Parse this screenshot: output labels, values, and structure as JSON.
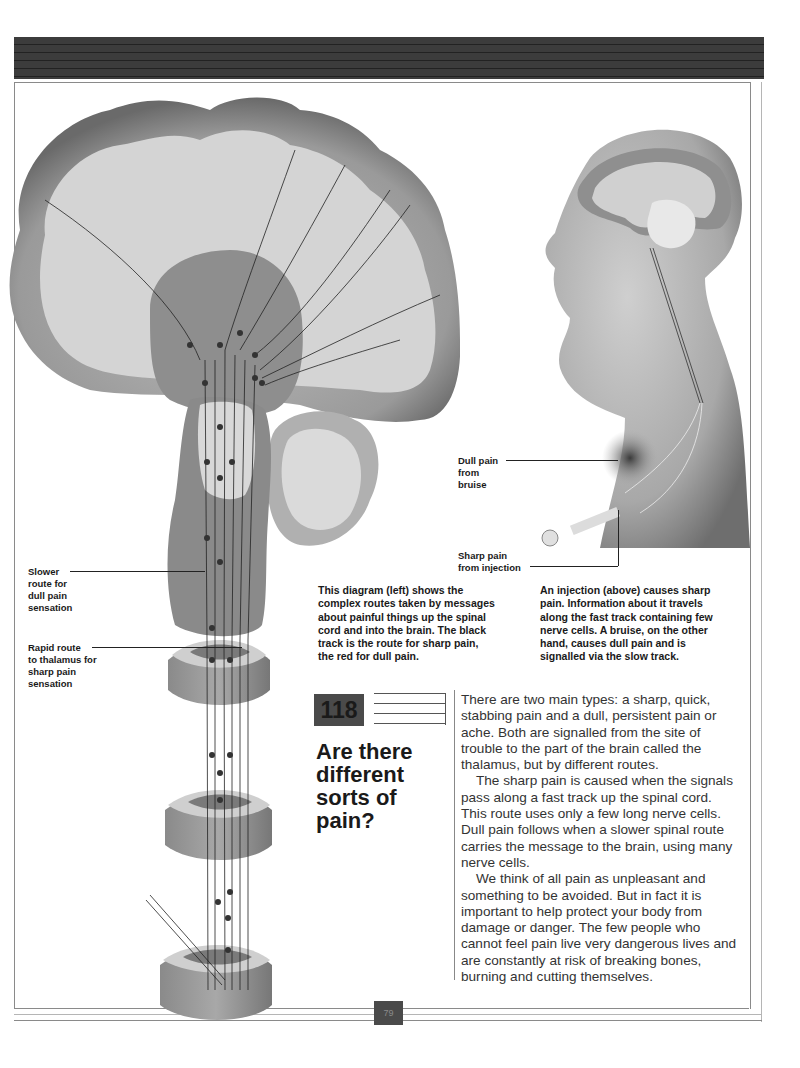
{
  "page": {
    "number": "79",
    "header_band": "decorative striped header bar"
  },
  "diagram_left": {
    "description": "Cross-section of brain and spinal cord showing pain pathways",
    "labels": {
      "slower_route": [
        "Slower",
        "route for",
        "dull pain",
        "sensation"
      ],
      "rapid_route": [
        "Rapid route",
        "to thalamus for",
        "sharp pain",
        "sensation"
      ]
    }
  },
  "diagram_right": {
    "description": "Side profile of head and torso with injection and bruise",
    "labels": {
      "dull_pain": [
        "Dull pain",
        "from",
        "bruise"
      ],
      "sharp_pain": [
        "Sharp pain",
        "from injection"
      ]
    }
  },
  "captions": {
    "left": [
      "This diagram (left) shows the",
      "complex routes taken by messages",
      "about painful things up the spinal",
      "cord and into the brain. The black",
      "track is the route for sharp pain,",
      "the red for dull pain."
    ],
    "right": [
      "An injection (above) causes sharp",
      "pain. Information about it travels",
      "along the fast track containing few",
      "nerve cells. A bruise, on the other",
      "hand, causes dull pain and is",
      "signalled via the slow track."
    ]
  },
  "question": {
    "number": "118",
    "title_lines": [
      "Are there",
      "different",
      "sorts of",
      "pain?"
    ]
  },
  "body": {
    "paragraphs": [
      "There are two main types: a sharp, quick, stabbing pain and a dull, persistent pain or ache. Both are signalled from the site of trouble to the part of the brain called the thalamus, but by different routes.",
      "The sharp pain is caused when the signals pass along a fast track up the spinal cord. This route uses only a few long nerve cells. Dull pain follows when a slower spinal route carries the message to the brain, using many nerve cells.",
      "We think of all pain as unpleasant and something to be avoided. But in fact it is important to help protect your body from damage or danger. The few people who cannot feel pain live very dangerous lives and are constantly at risk of breaking bones, burning and cutting themselves."
    ]
  },
  "colors": {
    "header_band": "#3a3a3a",
    "number_box": "#4a4a4a",
    "text": "#1a1a1a",
    "body_text": "#333333"
  }
}
